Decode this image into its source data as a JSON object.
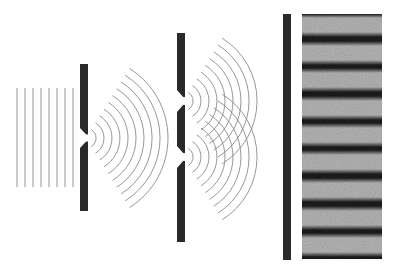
{
  "diagram": {
    "colors": {
      "background": "#ffffff",
      "barrier": "#2a2a2a",
      "wave_line": "#8a8a8a",
      "fringe_dark": "#1c1c1c",
      "fringe_bright": "#b5b5b5"
    },
    "plane_waves": {
      "x_positions": [
        17,
        25,
        33,
        41,
        49,
        57,
        65,
        73
      ],
      "y_top": 88,
      "y_bottom": 187
    },
    "single_slit_barrier": {
      "x": 80,
      "width": 8,
      "y_top": 64,
      "y_bottom": 211,
      "slit_center_y": 138,
      "slit_half": 10
    },
    "single_slit_waves": {
      "cx": 86,
      "cy": 138,
      "radii": [
        10,
        18,
        26,
        34,
        42,
        50,
        58,
        66,
        74,
        82
      ],
      "half_angle_deg": 58
    },
    "double_slit_barrier": {
      "x": 177,
      "width": 8,
      "y_top": 33,
      "y_bottom": 242,
      "slit_centers_y": [
        101,
        157
      ],
      "slit_half": 11
    },
    "double_slit_waves": {
      "cx": 183,
      "radii": [
        10,
        18,
        26,
        34,
        42,
        50,
        58,
        66,
        74
      ],
      "half_angle_deg": 58
    },
    "screen_bar": {
      "x": 283,
      "width": 8,
      "y_top": 14,
      "y_bottom": 260
    },
    "fringe_panel": {
      "x": 302,
      "width": 80,
      "y_top": 14,
      "y_bottom": 259,
      "bright_band_centers_y": [
        25,
        53,
        80,
        108,
        135,
        162,
        190,
        218,
        245
      ],
      "band_half_width": 7
    },
    "caption": "· · ·   · · · ·"
  }
}
